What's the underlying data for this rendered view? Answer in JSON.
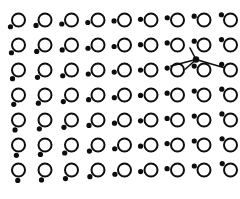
{
  "figure": {
    "title": "",
    "width": 240,
    "height": 199,
    "background_color": "#ffffff",
    "ink_color": "#0d0d0d"
  },
  "chart_data": {
    "type": "scatter",
    "title": "",
    "subtitle": "",
    "xlabel": "",
    "ylabel": "",
    "xlim": [
      0,
      240
    ],
    "ylim": [
      0,
      199
    ],
    "grid": false,
    "legend_position": "none",
    "annotations": [],
    "tick_labels": {
      "x": [],
      "y": []
    },
    "lattice": {
      "columns": 9,
      "rows": 7,
      "column_spacing": 26.5,
      "row_spacing": 25.0,
      "origin_x": 18.5,
      "origin_y": 20.0,
      "ring_diameter": 13.0,
      "ring_stroke_width": 2.0,
      "dot_diameter": 5.2,
      "satellite_radius": 10.5,
      "satellite_bearing_deg": {
        "note": "bearing measured clockwise from straight-down (0 = directly below ring center); interpolated bilinearly across the lattice",
        "top_left": -50,
        "top_right": -120,
        "bottom_left": -4,
        "bottom_right": -128
      }
    },
    "series": [
      {
        "name": "ring-glyphs",
        "marker": "open-circle",
        "count": 63,
        "x": [
          18.5,
          45.0,
          71.5,
          98.0,
          124.5,
          151.0,
          177.5,
          204.0,
          230.5,
          18.5,
          45.0,
          71.5,
          98.0,
          124.5,
          151.0,
          177.5,
          204.0,
          230.5,
          18.5,
          45.0,
          71.5,
          98.0,
          124.5,
          151.0,
          177.5,
          204.0,
          230.5,
          18.5,
          45.0,
          71.5,
          98.0,
          124.5,
          151.0,
          177.5,
          204.0,
          230.5,
          18.5,
          45.0,
          71.5,
          98.0,
          124.5,
          151.0,
          177.5,
          204.0,
          230.5,
          18.5,
          45.0,
          71.5,
          98.0,
          124.5,
          151.0,
          177.5,
          204.0,
          230.5,
          18.5,
          45.0,
          71.5,
          98.0,
          124.5,
          151.0,
          177.5,
          204.0,
          230.5
        ],
        "y": [
          20.0,
          20.0,
          20.0,
          20.0,
          20.0,
          20.0,
          20.0,
          20.0,
          20.0,
          45.0,
          45.0,
          45.0,
          45.0,
          45.0,
          45.0,
          45.0,
          45.0,
          45.0,
          70.0,
          70.0,
          70.0,
          70.0,
          70.0,
          70.0,
          70.0,
          70.0,
          70.0,
          95.0,
          95.0,
          95.0,
          95.0,
          95.0,
          95.0,
          95.0,
          95.0,
          95.0,
          120.0,
          120.0,
          120.0,
          120.0,
          120.0,
          120.0,
          120.0,
          120.0,
          120.0,
          145.0,
          145.0,
          145.0,
          145.0,
          145.0,
          145.0,
          145.0,
          145.0,
          145.0,
          170.0,
          170.0,
          170.0,
          170.0,
          170.0,
          170.0,
          170.0,
          170.0,
          170.0
        ]
      },
      {
        "name": "satellite-dots",
        "marker": "filled-circle",
        "count": 63
      }
    ],
    "overlay_graph": {
      "type": "node-link",
      "hub": {
        "x": 196.0,
        "y": 59.5
      },
      "edges": [
        {
          "from": "hub",
          "to_x": 190.0,
          "to_y": 48.0,
          "label": ""
        },
        {
          "from": "hub",
          "to_x": 171.0,
          "to_y": 66.0,
          "label": ""
        },
        {
          "from": "hub",
          "to_x": 185.5,
          "to_y": 69.0,
          "label": ""
        },
        {
          "from": "hub",
          "to_x": 223.5,
          "to_y": 67.5,
          "label": ""
        }
      ],
      "hub_dot_diameter": 6.5,
      "edge_stroke_width": 1.6
    }
  }
}
